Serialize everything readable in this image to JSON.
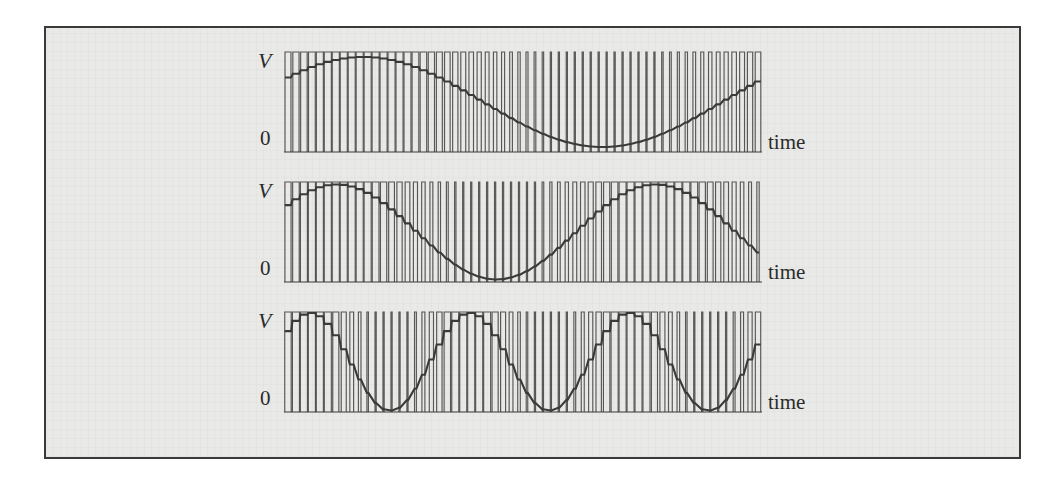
{
  "figure": {
    "type": "pwm-waveform-plate",
    "caption_visible": false,
    "background_color": "#e9e9e7",
    "frame_color": "#3a3a3a",
    "trace_color": "#3a3a3a",
    "pulse_color": "#4a4a4a",
    "page_color": "#ffffff"
  },
  "axes": {
    "v_label": "V",
    "zero_label": "0",
    "time_label": "time"
  },
  "rows": [
    {
      "id": "row-1",
      "v_label": "V",
      "zero_label": "0",
      "time_label": "time"
    },
    {
      "id": "row-2",
      "v_label": "V",
      "zero_label": "0",
      "time_label": "time"
    },
    {
      "id": "row-3",
      "v_label": "V",
      "zero_label": "0",
      "time_label": "time"
    }
  ],
  "chart_data": {
    "type": "line",
    "title": "",
    "subtitle": "",
    "xlabel": "time",
    "ylabel": "V",
    "grid": false,
    "legend": "none",
    "xlim": [
      0,
      1
    ],
    "ylim": [
      0,
      1
    ],
    "series": [
      {
        "name": "panel-1-reference-sine",
        "panel": 1,
        "carrier_pulses": 60,
        "modulation_cycles": 1.0,
        "modulation_phase_deg": 30,
        "amplitude": 0.9,
        "offset": 0.5,
        "x": [
          0.0,
          0.05,
          0.1,
          0.15,
          0.2,
          0.25,
          0.3,
          0.35,
          0.4,
          0.45,
          0.5,
          0.55,
          0.6,
          0.65,
          0.7,
          0.75,
          0.8,
          0.85,
          0.9,
          0.95,
          1.0
        ],
        "values": [
          0.5,
          0.57,
          0.64,
          0.71,
          0.77,
          0.83,
          0.88,
          0.92,
          0.96,
          0.98,
          0.99,
          0.99,
          0.97,
          0.94,
          0.9,
          0.85,
          0.79,
          0.72,
          0.65,
          0.58,
          0.5
        ]
      },
      {
        "name": "panel-2-reference-sine",
        "panel": 2,
        "carrier_pulses": 60,
        "modulation_cycles": 1.5,
        "modulation_phase_deg": 30,
        "amplitude": 0.95,
        "offset": 0.5,
        "x": [
          0.0,
          0.05,
          0.1,
          0.15,
          0.2,
          0.25,
          0.3,
          0.35,
          0.4,
          0.45,
          0.5,
          0.55,
          0.6,
          0.65,
          0.7,
          0.75,
          0.8,
          0.85,
          0.9,
          0.95,
          1.0
        ],
        "values": [
          0.55,
          0.72,
          0.86,
          0.96,
          1.0,
          0.98,
          0.91,
          0.79,
          0.64,
          0.48,
          0.33,
          0.19,
          0.09,
          0.03,
          0.01,
          0.05,
          0.14,
          0.27,
          0.43,
          0.6,
          0.76
        ]
      },
      {
        "name": "panel-3-reference-sine",
        "panel": 3,
        "carrier_pulses": 60,
        "modulation_cycles": 3.0,
        "modulation_phase_deg": 30,
        "amplitude": 0.98,
        "offset": 0.5,
        "x": [
          0.0,
          0.05,
          0.1,
          0.15,
          0.2,
          0.25,
          0.3,
          0.35,
          0.4,
          0.45,
          0.5,
          0.55,
          0.6,
          0.65,
          0.7,
          0.75,
          0.8,
          0.85,
          0.9,
          0.95,
          1.0
        ],
        "values": [
          0.62,
          0.94,
          1.0,
          0.79,
          0.41,
          0.09,
          0.0,
          0.18,
          0.57,
          0.9,
          1.0,
          0.85,
          0.49,
          0.14,
          0.0,
          0.12,
          0.47,
          0.84,
          1.0,
          0.88,
          0.54
        ]
      }
    ]
  }
}
